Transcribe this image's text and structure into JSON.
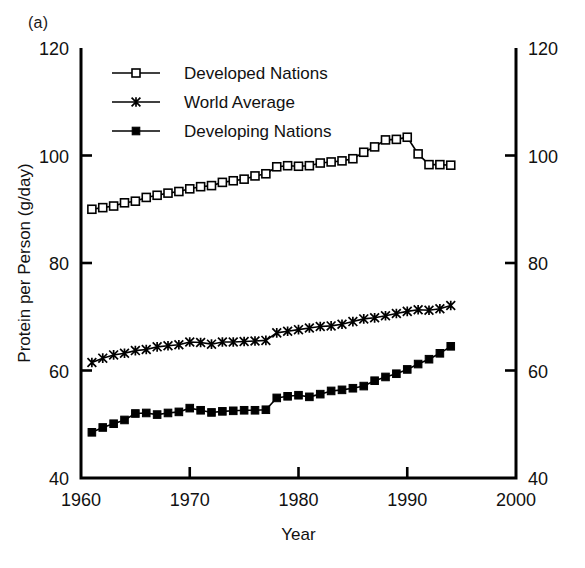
{
  "panel": {
    "label": "(a)"
  },
  "chart_data": {
    "type": "line",
    "title": "",
    "subtitle": "",
    "xlabel": "Year",
    "ylabel": "Protein per Person (g/day)",
    "xlim": [
      1960,
      2000
    ],
    "ylim": [
      40,
      120
    ],
    "xticks": [
      1960,
      1970,
      1980,
      1990,
      2000
    ],
    "xtick_labels": [
      "1960",
      "1970",
      "1980",
      "1990",
      "2000"
    ],
    "yticks": [
      40,
      60,
      80,
      100,
      120
    ],
    "ytick_labels": [
      "40",
      "60",
      "80",
      "100",
      "120"
    ],
    "ytick_labels_right": [
      "40",
      "60",
      "80",
      "100",
      "120"
    ],
    "grid": false,
    "legend_position": "top-left-inside",
    "dual_y_axis": true,
    "x": [
      1961,
      1962,
      1963,
      1964,
      1965,
      1966,
      1967,
      1968,
      1969,
      1970,
      1971,
      1972,
      1973,
      1974,
      1975,
      1976,
      1977,
      1978,
      1979,
      1980,
      1981,
      1982,
      1983,
      1984,
      1985,
      1986,
      1987,
      1988,
      1989,
      1990,
      1991,
      1992,
      1993,
      1994
    ],
    "series": [
      {
        "name": "Developed Nations",
        "marker": "open-square",
        "values": [
          90.0,
          90.3,
          90.6,
          91.2,
          91.5,
          92.2,
          92.6,
          93.0,
          93.3,
          93.8,
          94.2,
          94.4,
          95.0,
          95.3,
          95.6,
          96.2,
          96.6,
          97.9,
          98.1,
          98.0,
          98.1,
          98.6,
          98.8,
          99.0,
          99.4,
          100.6,
          101.6,
          102.9,
          103.0,
          103.4,
          100.3,
          98.3,
          98.3,
          98.2
        ]
      },
      {
        "name": "World Average",
        "marker": "star-x",
        "values": [
          61.5,
          62.3,
          62.9,
          63.2,
          63.7,
          63.9,
          64.4,
          64.6,
          64.8,
          65.3,
          65.2,
          64.9,
          65.3,
          65.3,
          65.4,
          65.5,
          65.6,
          67.0,
          67.3,
          67.6,
          67.9,
          68.2,
          68.3,
          68.6,
          69.1,
          69.6,
          69.8,
          70.2,
          70.6,
          71.0,
          71.3,
          71.2,
          71.5,
          72.1
        ]
      },
      {
        "name": "Developing Nations",
        "marker": "filled-square",
        "values": [
          48.5,
          49.4,
          50.1,
          50.8,
          52.0,
          52.1,
          51.8,
          52.1,
          52.3,
          53.0,
          52.6,
          52.2,
          52.4,
          52.5,
          52.6,
          52.6,
          52.7,
          54.9,
          55.2,
          55.4,
          55.1,
          55.6,
          56.2,
          56.4,
          56.7,
          57.1,
          58.1,
          58.8,
          59.4,
          60.2,
          61.2,
          62.1,
          63.2,
          64.5
        ]
      }
    ]
  }
}
